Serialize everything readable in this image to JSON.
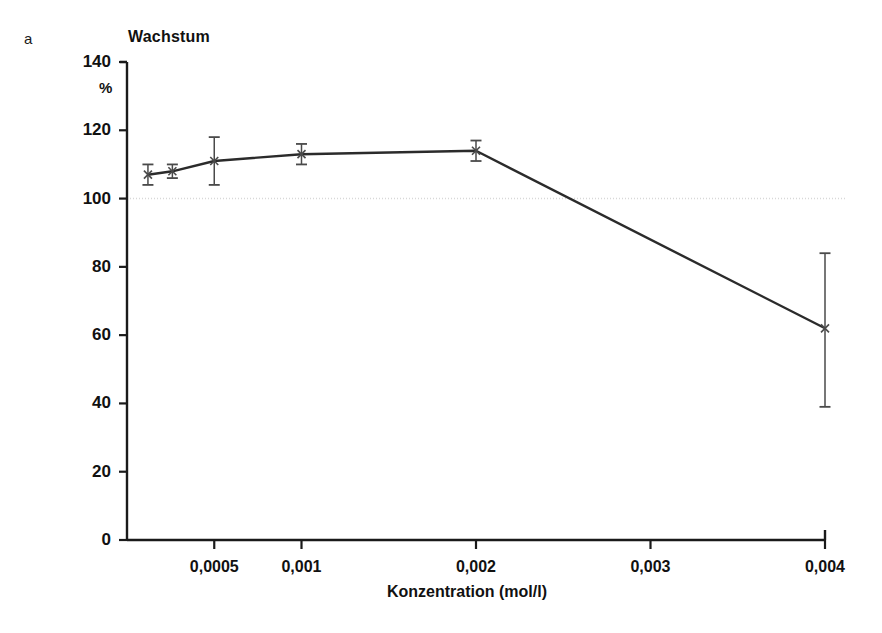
{
  "panel": {
    "label": "a"
  },
  "chart_data": {
    "type": "line",
    "title": "Wachstum",
    "ylabel": "%",
    "xlabel": "Konzentration (mol/l)",
    "ylim": [
      0,
      140
    ],
    "xlim": [
      0,
      0.004
    ],
    "grid": false,
    "legend": null,
    "reference_line": {
      "y": 100,
      "style": "dotted",
      "color": "#d8d8d8"
    },
    "ytick_labels": [
      "0",
      "20",
      "40",
      "60",
      "80",
      "100",
      "120",
      "140"
    ],
    "yticks": [
      0,
      20,
      40,
      60,
      80,
      100,
      120,
      140
    ],
    "xtick_labels": [
      "0,0005",
      "0,001",
      "0,002",
      "0,003",
      "0,004"
    ],
    "xticks": [
      0.0005,
      0.001,
      0.002,
      0.003,
      0.004
    ],
    "marker": "x-cross",
    "x": [
      0.00012,
      0.00026,
      0.0005,
      0.001,
      0.002,
      0.004
    ],
    "values": [
      107,
      108,
      111,
      113,
      114,
      62
    ],
    "error_upper": [
      110,
      110,
      118,
      116,
      117,
      84
    ],
    "error_lower": [
      104,
      106,
      104,
      110,
      111,
      39
    ],
    "series": [
      {
        "name": "Wachstum",
        "points": [
          {
            "x": 0.00012,
            "y": 107,
            "err_hi": 110,
            "err_lo": 104
          },
          {
            "x": 0.00026,
            "y": 108,
            "err_hi": 110,
            "err_lo": 106
          },
          {
            "x": 0.0005,
            "y": 111,
            "err_hi": 118,
            "err_lo": 104
          },
          {
            "x": 0.001,
            "y": 113,
            "err_hi": 116,
            "err_lo": 110
          },
          {
            "x": 0.002,
            "y": 114,
            "err_hi": 117,
            "err_lo": 111
          },
          {
            "x": 0.004,
            "y": 62,
            "err_hi": 84,
            "err_lo": 39
          }
        ]
      }
    ]
  },
  "colors": {
    "axis": "#1a1a1a",
    "line": "#2b2b2b",
    "marker": "#4a4a4a",
    "reference": "#dcdcdc",
    "background": "#ffffff"
  }
}
